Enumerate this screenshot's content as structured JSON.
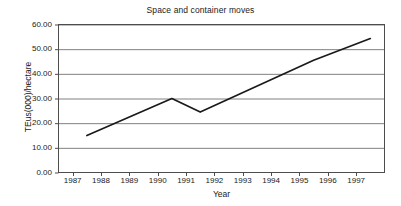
{
  "chart_data": {
    "type": "line",
    "title": "Space and container moves",
    "xlabel": "Year",
    "ylabel": "TEus(000)/hectare",
    "xlim": [
      1986.5,
      1998.0
    ],
    "ylim": [
      0,
      60
    ],
    "grid": true,
    "legend": false,
    "xticks": [
      "1987",
      "1988",
      "1989",
      "1990",
      "1991",
      "1992",
      "1993",
      "1994",
      "1995",
      "1996",
      "1997"
    ],
    "xtick_values": [
      1987,
      1988,
      1989,
      1990,
      1991,
      1992,
      1993,
      1994,
      1995,
      1996,
      1997
    ],
    "yticks": [
      "0.00",
      "10.00",
      "20.00",
      "30.00",
      "40.00",
      "50.00",
      "60.00"
    ],
    "ytick_values": [
      0,
      10,
      20,
      30,
      40,
      50,
      60
    ],
    "series": [
      {
        "name": "TEus(000)/hectare",
        "color": "#1a1a1a",
        "x": [
          1987.5,
          1990.5,
          1991.5,
          1995.5,
          1997.5
        ],
        "values": [
          15.0,
          30.0,
          24.5,
          45.5,
          54.3
        ]
      }
    ]
  },
  "style": {
    "line_color": "#1a1a1a",
    "grid_color": "#808080",
    "axis_color": "#4d4d4d",
    "background": "#ffffff",
    "text_color": "#1a1a1a"
  }
}
